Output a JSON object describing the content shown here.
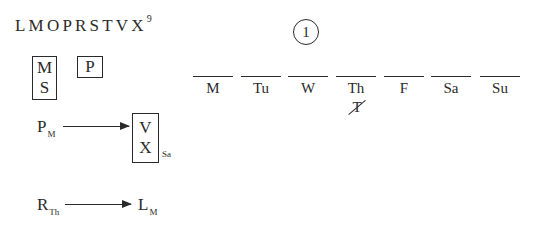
{
  "roster": {
    "letters": "LMOPRSTVX",
    "count": "9"
  },
  "boxes": {
    "group_ms": [
      "M",
      "S"
    ],
    "group_p": [
      "P"
    ]
  },
  "rules": [
    {
      "from": {
        "letter": "P",
        "sub": "M"
      },
      "to_box": [
        "V",
        "X"
      ],
      "to_sub": "Sa"
    },
    {
      "from": {
        "letter": "R",
        "sub": "Th"
      },
      "to": {
        "letter": "L",
        "sub": "M"
      }
    }
  ],
  "question": {
    "number": "1"
  },
  "schedule": {
    "days": [
      "M",
      "Tu",
      "W",
      "Th",
      "F",
      "Sa",
      "Su"
    ],
    "crossed_out": {
      "day": "Th",
      "letter": "T"
    }
  },
  "colors": {
    "ink": "#2a2a2a",
    "background": "#ffffff"
  }
}
